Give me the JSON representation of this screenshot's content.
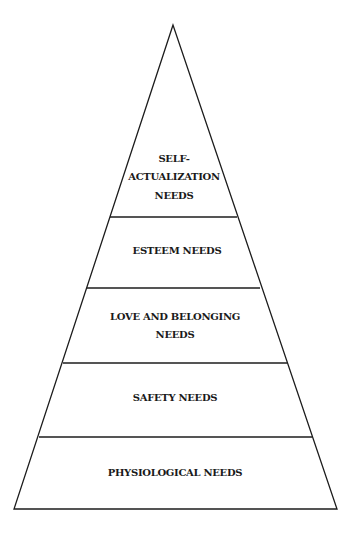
{
  "diagram": {
    "type": "pyramid",
    "title": "",
    "line_color": "#1c1c1c",
    "text_color": "#1a1a1a",
    "background": "#ffffff",
    "levels": [
      {
        "order": 5,
        "position": "top",
        "lines": [
          "SELF-",
          "ACTUALIZATION",
          "NEEDS"
        ]
      },
      {
        "order": 4,
        "position": "second",
        "lines": [
          "ESTEEM NEEDS"
        ]
      },
      {
        "order": 3,
        "position": "middle",
        "lines": [
          "LOVE AND BELONGING",
          "NEEDS"
        ]
      },
      {
        "order": 2,
        "position": "fourth",
        "lines": [
          "SAFETY NEEDS"
        ]
      },
      {
        "order": 1,
        "position": "base",
        "lines": [
          "PHYSIOLOGICAL NEEDS"
        ]
      }
    ]
  }
}
